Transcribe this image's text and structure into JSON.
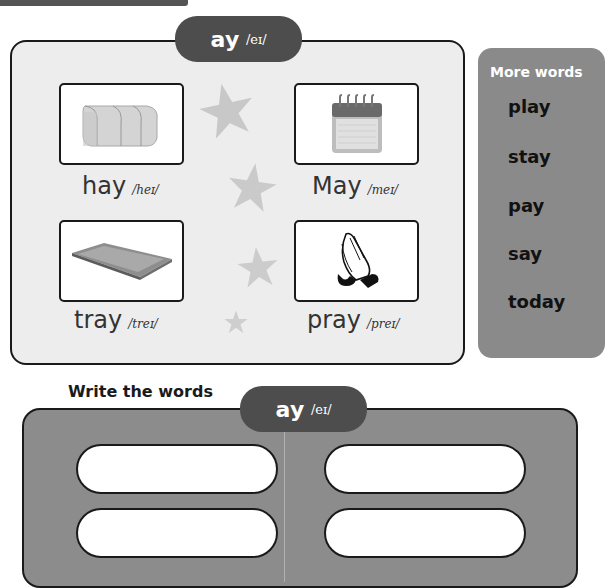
{
  "header": {
    "sound_letters": "ay",
    "sound_ipa": "/eɪ/"
  },
  "words": [
    {
      "word": "hay",
      "ipa": "/heɪ/",
      "picture": "hay-bale"
    },
    {
      "word": "May",
      "ipa": "/meɪ/",
      "picture": "calendar"
    },
    {
      "word": "tray",
      "ipa": "/treɪ/",
      "picture": "tray"
    },
    {
      "word": "pray",
      "ipa": "/preɪ/",
      "picture": "praying-hands"
    }
  ],
  "more_words": {
    "title": "More words",
    "items": [
      "play",
      "stay",
      "pay",
      "say",
      "today"
    ]
  },
  "write": {
    "title": "Write the words",
    "sound_letters": "ay",
    "sound_ipa": "/eɪ/",
    "slots": [
      "",
      "",
      "",
      ""
    ]
  },
  "colors": {
    "pill": "#4d4d4d",
    "panel_bg": "#ededed",
    "more_panel": "#8a8a8a",
    "write_panel": "#8c8c8c",
    "star": "#c8c8c8"
  }
}
